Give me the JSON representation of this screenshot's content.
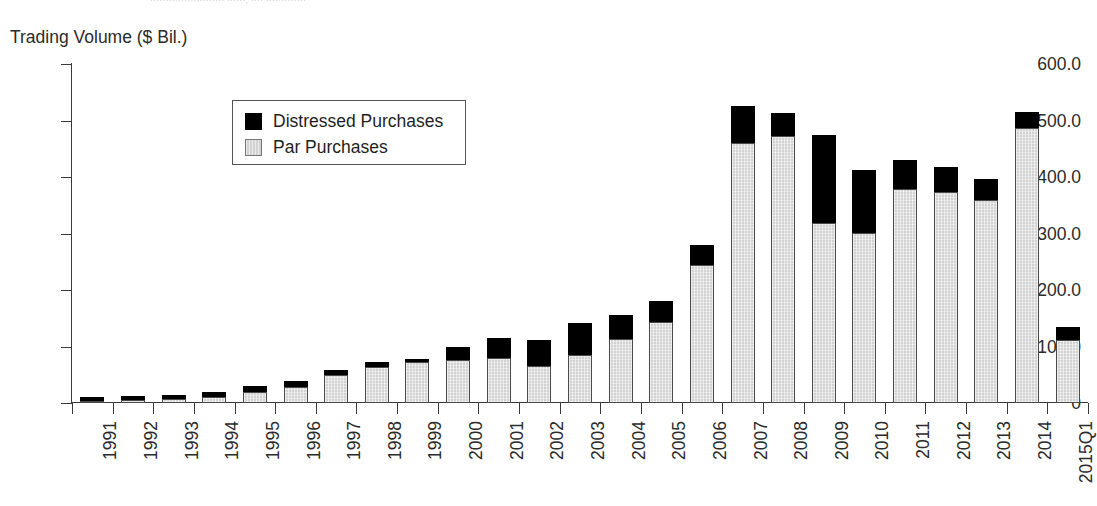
{
  "top_cut_text": "························ ······, ···· ·············",
  "axis_title": "Trading Volume ($ Bil.)",
  "legend": {
    "position": "inside-top-left",
    "entries": [
      {
        "label": "Distressed Purchases",
        "swatch": "black-square-icon",
        "color": "#000000"
      },
      {
        "label": "Par Purchases",
        "swatch": "grey-square-icon",
        "color": "#d2d2d2"
      }
    ]
  },
  "chart_data": {
    "type": "bar",
    "stacked": true,
    "title": "",
    "subtitle": "",
    "xlabel": "",
    "ylabel": "Trading Volume ($ Bil.)",
    "ylim": [
      0,
      600
    ],
    "ytick_labels": [
      "600.0",
      "500.0",
      "400.0",
      "300.0",
      "200.0",
      "100.0",
      "0"
    ],
    "ytick_values": [
      600,
      500,
      400,
      300,
      200,
      100,
      0
    ],
    "grid": false,
    "legend_position": "upper left (inside plot)",
    "categories": [
      "1991",
      "1992",
      "1993",
      "1994",
      "1995",
      "1996",
      "1997",
      "1998",
      "1999",
      "2000",
      "2001",
      "2002",
      "2003",
      "2004",
      "2005",
      "2006",
      "2007",
      "2008",
      "2009",
      "2010",
      "2011",
      "2012",
      "2013",
      "2014",
      "2015Q1"
    ],
    "series": [
      {
        "name": "Par Purchases",
        "color": "#d2d2d2",
        "values": [
          4,
          5,
          7,
          11,
          20,
          29,
          50,
          64,
          72,
          76,
          80,
          66,
          85,
          113,
          144,
          244,
          460,
          472,
          318,
          301,
          379,
          374,
          360,
          487,
          111
        ]
      },
      {
        "name": "Distressed Purchases",
        "color": "#000000",
        "values": [
          7,
          7,
          8,
          8,
          10,
          10,
          9,
          9,
          6,
          24,
          35,
          45,
          57,
          42,
          36,
          36,
          66,
          42,
          156,
          112,
          51,
          44,
          36,
          28,
          23
        ]
      }
    ],
    "totals": [
      11,
      12,
      15,
      19,
      30,
      39,
      59,
      73,
      78,
      100,
      115,
      111,
      142,
      155,
      180,
      280,
      526,
      514,
      474,
      413,
      430,
      418,
      396,
      515,
      134
    ]
  }
}
